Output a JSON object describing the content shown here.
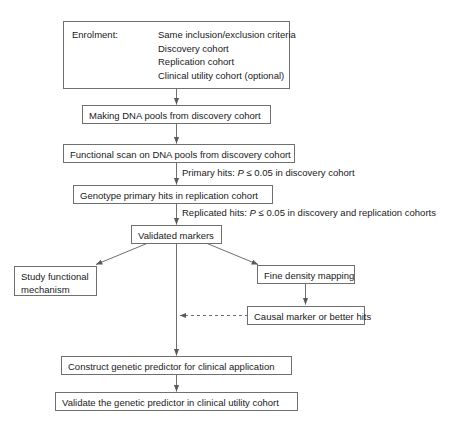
{
  "diagram": {
    "colors": {
      "box_border": "#6f6f6f",
      "line": "#6f6f6f",
      "text": "#1a1a1a",
      "background": "#ffffff"
    },
    "enrolment": {
      "label": "Enrolment:",
      "items": [
        "Same inclusion/exclusion criteria",
        "Discovery cohort",
        "Replication cohort",
        "Clinical utility cohort (optional)"
      ]
    },
    "nodes": {
      "making_pools": "Making DNA pools from discovery cohort",
      "functional_scan": "Functional scan on DNA pools from discovery cohort",
      "genotype_primary": "Genotype primary hits in replication cohort",
      "validated_markers": "Validated markers",
      "study_functional": "Study functional mechanism",
      "fine_density": "Fine density mapping",
      "causal_marker": "Causal marker or better hits",
      "construct_predictor": "Construct genetic predictor for clinical application",
      "validate_predictor": "Validate the genetic predictor in clinical utility cohort"
    },
    "annotations": {
      "primary_hits": {
        "prefix": "Primary hits: ",
        "symbol": "P",
        "suffix": " ≤ 0.05 in discovery cohort"
      },
      "replicated_hits": {
        "prefix": "Replicated hits: ",
        "symbol": "P",
        "suffix": " ≤ 0.05 in discovery and replication cohorts"
      }
    }
  }
}
